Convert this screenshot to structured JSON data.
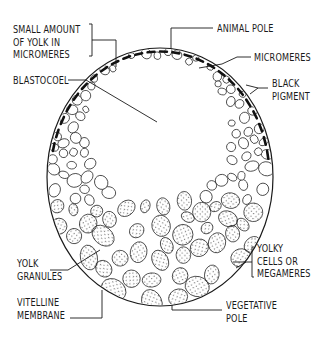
{
  "diagram": {
    "colors": {
      "ink": "#1a1a1a",
      "background": "#ffffff",
      "stipple": "#333333"
    },
    "embryo": {
      "cx": 160,
      "cy": 177,
      "rx": 113,
      "ry": 129
    },
    "labels": {
      "small_yolk": {
        "lines": [
          "SMALL AMOUNT",
          "OF YOLK IN",
          "MICROMERES"
        ],
        "text": "SMALL AMOUNT\nOF YOLK IN\nMICROMERES"
      },
      "blastocoel": {
        "text": "BLASTOCOEL"
      },
      "animal_pole": {
        "text": "ANIMAL POLE"
      },
      "micromeres": {
        "text": "MICROMERES"
      },
      "black_pigment": {
        "text": "BLACK\nPIGMENT"
      },
      "yolky_cells": {
        "text": "YOLKY\nCELLS OR\nMEGAMERES"
      },
      "vegetative_pole": {
        "text": "VEGETATIVE\nPOLE"
      },
      "yolk_granules": {
        "text": "YOLK\nGRANULES"
      },
      "vitelline_membrane": {
        "text": "VITELLINE\nMEMBRANE"
      }
    }
  }
}
